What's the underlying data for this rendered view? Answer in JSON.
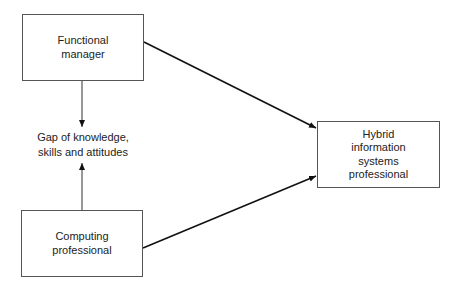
{
  "diagram": {
    "nodes": [
      {
        "id": "functional_manager",
        "label": "Functional\nmanager"
      },
      {
        "id": "computing_professional",
        "label": "Computing\nprofessional"
      },
      {
        "id": "hybrid_is_professional",
        "label": "Hybrid\ninformation\nsystems\nprofessional"
      }
    ],
    "gap_label": "Gap of knowledge,\nskills and attitudes",
    "edges": [
      {
        "from": "functional_manager",
        "to": "gap_label"
      },
      {
        "from": "computing_professional",
        "to": "gap_label"
      },
      {
        "from": "functional_manager",
        "to": "hybrid_is_professional"
      },
      {
        "from": "computing_professional",
        "to": "hybrid_is_professional"
      }
    ]
  }
}
